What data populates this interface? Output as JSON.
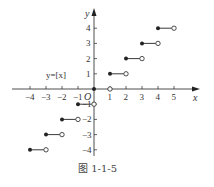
{
  "chart_data": {
    "type": "line",
    "title": "",
    "function_label": "y=[x]",
    "xlabel": "x",
    "ylabel": "y",
    "origin_label": "O",
    "xlim": [
      -4.5,
      5.8
    ],
    "ylim": [
      -4.5,
      4.8
    ],
    "x_ticks": [
      -4,
      -3,
      -2,
      -1,
      1,
      2,
      3,
      4,
      5
    ],
    "y_ticks": [
      -4,
      -3,
      -2,
      -1,
      1,
      2,
      3,
      4
    ],
    "grid": false,
    "series": [
      {
        "name": "y=[x]",
        "style": "step-segments (closed left endpoint, open right endpoint)",
        "segments": [
          {
            "x_start": -4,
            "x_end": -3,
            "y": -4
          },
          {
            "x_start": -3,
            "x_end": -2,
            "y": -3
          },
          {
            "x_start": -2,
            "x_end": -1,
            "y": -2
          },
          {
            "x_start": -1,
            "x_end": 0,
            "y": -1
          },
          {
            "x_start": 0,
            "x_end": 1,
            "y": 0
          },
          {
            "x_start": 1,
            "x_end": 2,
            "y": 1
          },
          {
            "x_start": 2,
            "x_end": 3,
            "y": 2
          },
          {
            "x_start": 3,
            "x_end": 4,
            "y": 3
          },
          {
            "x_start": 4,
            "x_end": 5,
            "y": 4
          }
        ]
      }
    ]
  },
  "caption": "图 1-1-5",
  "colors": {
    "line": "#222222",
    "text": "#333333"
  }
}
